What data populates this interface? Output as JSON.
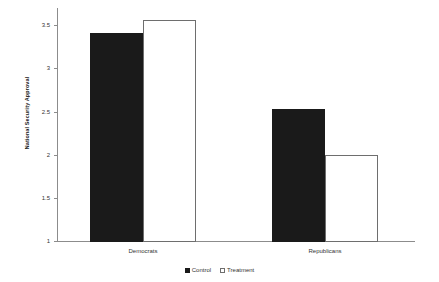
{
  "chart_data": {
    "type": "bar",
    "title": "",
    "subtitle": "",
    "xlabel": "",
    "ylabel": "National Security Approval",
    "categories": [
      "Democrats",
      "Republicans"
    ],
    "series": [
      {
        "name": "Control",
        "color": "#1a1a1a",
        "values": [
          3.41,
          2.53
        ]
      },
      {
        "name": "Treatment",
        "color": "#ffffff",
        "values": [
          3.56,
          2.0
        ]
      }
    ],
    "ylim": [
      1,
      3.6
    ],
    "yticks": [
      1,
      1.5,
      2,
      2.5,
      3,
      3.5
    ],
    "ytick_labels": [
      "1",
      "1.5",
      "2",
      "2.5",
      "3",
      "3.5"
    ],
    "grid": false,
    "legend_position": "bottom",
    "legend": [
      "Control",
      "Treatment"
    ]
  },
  "axis": {
    "y_title": "National Security Approval",
    "ticks": [
      {
        "label": "3.5",
        "value": 3.5
      },
      {
        "label": "3",
        "value": 3
      },
      {
        "label": "2.5",
        "value": 2.5
      },
      {
        "label": "2",
        "value": 2
      },
      {
        "label": "1.5",
        "value": 1.5
      },
      {
        "label": "1",
        "value": 1
      }
    ]
  },
  "groups": [
    {
      "label": "Democrats"
    },
    {
      "label": "Republicans"
    }
  ],
  "legend": {
    "items": [
      {
        "label": "Control",
        "swatch": "filled-square-icon"
      },
      {
        "label": "Treatment",
        "swatch": "empty-square-icon"
      }
    ]
  }
}
